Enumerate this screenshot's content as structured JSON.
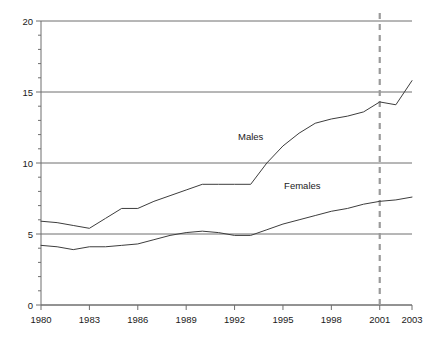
{
  "chart_data": {
    "type": "line",
    "title": "",
    "subtitle": "",
    "xlabel": "",
    "ylabel": "",
    "xlim": [
      1980,
      2003
    ],
    "ylim": [
      0,
      20
    ],
    "grid": true,
    "legend_position": "inline-annotation",
    "x": [
      1980,
      1981,
      1982,
      1983,
      1984,
      1985,
      1986,
      1987,
      1988,
      1989,
      1990,
      1991,
      1992,
      1993,
      1994,
      1995,
      1996,
      1997,
      1998,
      1999,
      2000,
      2001,
      2002,
      2003
    ],
    "y_major_ticks": [
      0,
      5,
      10,
      15,
      20
    ],
    "y_minor_tick_step": 1,
    "x_major_ticks": [
      1980,
      1983,
      1986,
      1989,
      1992,
      1995,
      1998,
      2001,
      2003
    ],
    "x_tick_labels": [
      "1980",
      "1983",
      "1986",
      "1989",
      "1992",
      "1995",
      "1998",
      "2001",
      "2003"
    ],
    "y_tick_labels": [
      "0",
      "5",
      "10",
      "15",
      "20"
    ],
    "series": [
      {
        "name": "Males",
        "color": "#3d3d3d",
        "label_x": 1993.0,
        "label_y": 11.6,
        "values": [
          5.9,
          5.8,
          5.6,
          5.4,
          6.1,
          6.8,
          6.8,
          7.3,
          7.7,
          8.1,
          8.5,
          8.5,
          8.5,
          8.5,
          10.0,
          11.2,
          12.1,
          12.8,
          13.1,
          13.3,
          13.6,
          14.3,
          14.1,
          15.8
        ]
      },
      {
        "name": "Females",
        "color": "#3d3d3d",
        "label_x": 1996.2,
        "label_y": 8.2,
        "values": [
          4.2,
          4.1,
          3.9,
          4.1,
          4.1,
          4.2,
          4.3,
          4.6,
          4.9,
          5.1,
          5.2,
          5.1,
          4.9,
          4.9,
          5.3,
          5.7,
          6.0,
          6.3,
          6.6,
          6.8,
          7.1,
          7.3,
          7.4,
          7.6
        ]
      }
    ],
    "annotations": [
      {
        "type": "vertical-dashed-line",
        "x": 2001,
        "color": "#9a9a9a"
      }
    ],
    "colors": {
      "axis": "#6e6e6e",
      "gridline": "#6e6e6e",
      "series_line": "#3d3d3d",
      "reference_line": "#9a9a9a",
      "text": "#1a1a1a",
      "background": "#ffffff"
    }
  }
}
